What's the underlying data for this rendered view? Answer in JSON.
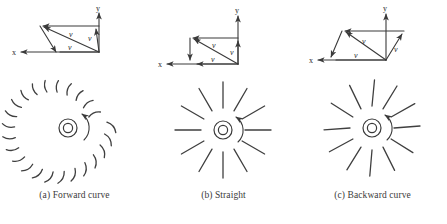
{
  "figure": {
    "background_color": "#ffffff",
    "stroke_color": "#3a3a3a",
    "panels": [
      {
        "id": "a",
        "caption": "(a) Forward curve",
        "blade_type": "forward-curved",
        "blade_count": 20,
        "rotation": "counter-clockwise",
        "axes": {
          "x_label": "x",
          "y_label": "y"
        },
        "velocity_labels": [
          "v",
          "v",
          "v"
        ],
        "velocity_shape": "slanted-parallelogram-left"
      },
      {
        "id": "b",
        "caption": "(b) Straight",
        "blade_type": "straight-radial",
        "blade_count": 12,
        "rotation": "counter-clockwise",
        "axes": {
          "x_label": "x",
          "y_label": "y"
        },
        "velocity_labels": [
          "v",
          "v",
          "v"
        ],
        "velocity_shape": "rectangle-with-diagonal"
      },
      {
        "id": "c",
        "caption": "(c) Backward curve",
        "blade_type": "backward-curved",
        "blade_count": 12,
        "rotation": "counter-clockwise",
        "axes": {
          "x_label": "x",
          "y_label": "y"
        },
        "velocity_labels": [
          "v",
          "v",
          "v"
        ],
        "velocity_shape": "slanted-parallelogram-right"
      }
    ]
  }
}
